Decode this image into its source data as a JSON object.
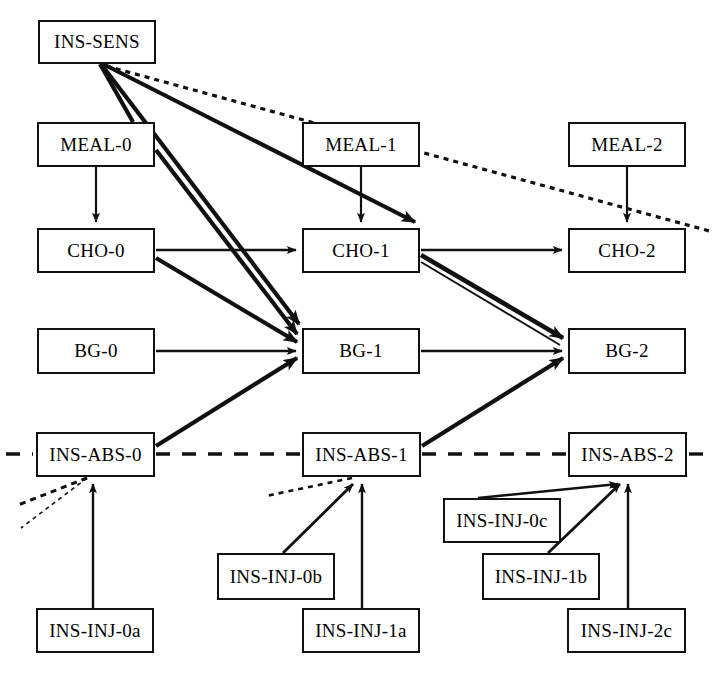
{
  "diagram": {
    "type": "directed-graph",
    "stroke_color": "#111111",
    "background_color": "#ffffff",
    "nodes": [
      {
        "id": "INS-SENS",
        "label": "INS-SENS",
        "x": 38,
        "y": 20,
        "w": 118,
        "h": 44
      },
      {
        "id": "MEAL-0",
        "label": "MEAL-0",
        "x": 37,
        "y": 122,
        "w": 118,
        "h": 45
      },
      {
        "id": "MEAL-1",
        "label": "MEAL-1",
        "x": 302,
        "y": 122,
        "w": 118,
        "h": 45
      },
      {
        "id": "MEAL-2",
        "label": "MEAL-2",
        "x": 568,
        "y": 122,
        "w": 118,
        "h": 45
      },
      {
        "id": "CHO-0",
        "label": "CHO-0",
        "x": 37,
        "y": 228,
        "w": 118,
        "h": 45
      },
      {
        "id": "CHO-1",
        "label": "CHO-1",
        "x": 302,
        "y": 228,
        "w": 118,
        "h": 45
      },
      {
        "id": "CHO-2",
        "label": "CHO-2",
        "x": 568,
        "y": 228,
        "w": 118,
        "h": 45
      },
      {
        "id": "BG-0",
        "label": "BG-0",
        "x": 37,
        "y": 328,
        "w": 118,
        "h": 46
      },
      {
        "id": "BG-1",
        "label": "BG-1",
        "x": 302,
        "y": 328,
        "w": 118,
        "h": 46
      },
      {
        "id": "BG-2",
        "label": "BG-2",
        "x": 568,
        "y": 328,
        "w": 118,
        "h": 46
      },
      {
        "id": "INS-ABS-0",
        "label": "INS-ABS-0",
        "x": 36,
        "y": 432,
        "w": 119,
        "h": 45
      },
      {
        "id": "INS-ABS-1",
        "label": "INS-ABS-1",
        "x": 302,
        "y": 432,
        "w": 119,
        "h": 45
      },
      {
        "id": "INS-ABS-2",
        "label": "INS-ABS-2",
        "x": 568,
        "y": 432,
        "w": 119,
        "h": 45
      },
      {
        "id": "INS-INJ-0c",
        "label": "INS-INJ-0c",
        "x": 443,
        "y": 498,
        "w": 118,
        "h": 45
      },
      {
        "id": "INS-INJ-0b",
        "label": "INS-INJ-0b",
        "x": 217,
        "y": 553,
        "w": 118,
        "h": 47
      },
      {
        "id": "INS-INJ-1b",
        "label": "INS-INJ-1b",
        "x": 482,
        "y": 553,
        "w": 118,
        "h": 47
      },
      {
        "id": "INS-INJ-0a",
        "label": "INS-INJ-0a",
        "x": 36,
        "y": 608,
        "w": 118,
        "h": 45
      },
      {
        "id": "INS-INJ-1a",
        "label": "INS-INJ-1a",
        "x": 302,
        "y": 608,
        "w": 118,
        "h": 45
      },
      {
        "id": "INS-INJ-2c",
        "label": "INS-INJ-2c",
        "x": 567,
        "y": 608,
        "w": 119,
        "h": 45
      }
    ],
    "edges": [
      {
        "from": "INS-SENS",
        "to": "MEAL-0",
        "style": "thick-plain"
      },
      {
        "from": "INS-SENS",
        "to": "CHO-1",
        "style": "thick-arrow"
      },
      {
        "from": "INS-SENS",
        "to": "BG-1",
        "style": "thick-arrow"
      },
      {
        "from": "INS-SENS",
        "to": "CHO-2",
        "style": "dotted"
      },
      {
        "from": "MEAL-0",
        "to": "CHO-0",
        "style": "thin-arrow"
      },
      {
        "from": "MEAL-1",
        "to": "CHO-1",
        "style": "thin-arrow"
      },
      {
        "from": "MEAL-2",
        "to": "CHO-2",
        "style": "thin-arrow"
      },
      {
        "from": "MEAL-0",
        "to": "BG-1",
        "style": "thick-arrow"
      },
      {
        "from": "CHO-0",
        "to": "CHO-1",
        "style": "thin-arrow"
      },
      {
        "from": "CHO-1",
        "to": "CHO-2",
        "style": "thin-arrow"
      },
      {
        "from": "CHO-0",
        "to": "BG-1",
        "style": "thick-arrow"
      },
      {
        "from": "CHO-1",
        "to": "BG-2",
        "style": "thick-arrow-double"
      },
      {
        "from": "BG-0",
        "to": "BG-1",
        "style": "thin-arrow"
      },
      {
        "from": "BG-1",
        "to": "BG-2",
        "style": "thin-arrow"
      },
      {
        "from": "INS-ABS-0",
        "to": "BG-1",
        "style": "thick-arrow"
      },
      {
        "from": "INS-ABS-1",
        "to": "BG-2",
        "style": "thick-arrow"
      },
      {
        "from": "INS-ABS-0",
        "to": "INS-ABS-1",
        "style": "dashed-plain"
      },
      {
        "from": "INS-ABS-1",
        "to": "INS-ABS-2",
        "style": "dashed-plain"
      },
      {
        "from": "INS-INJ-0a",
        "to": "INS-ABS-0",
        "style": "thin-arrow"
      },
      {
        "from": "INS-INJ-0b",
        "to": "INS-ABS-1",
        "style": "thin-arrow"
      },
      {
        "from": "INS-INJ-1a",
        "to": "INS-ABS-1",
        "style": "thin-arrow"
      },
      {
        "from": "INS-INJ-0c",
        "to": "INS-ABS-2",
        "style": "thin-arrow"
      },
      {
        "from": "INS-INJ-1b",
        "to": "INS-ABS-2",
        "style": "thin-arrow"
      },
      {
        "from": "INS-INJ-2c",
        "to": "INS-ABS-2",
        "style": "thin-arrow"
      }
    ],
    "edge_stubs": [
      {
        "name": "left-dash-stub",
        "note": "short dash at left margin entering INS-ABS-0"
      },
      {
        "name": "right-dash-stub",
        "note": "short dash at right margin leaving INS-ABS-2"
      },
      {
        "name": "dotted-stub-ins-abs-0a",
        "note": "dotted line from lower-left margin into INS-ABS-0"
      },
      {
        "name": "dotted-stub-ins-abs-0b",
        "note": "second dotted line from lower-left margin into INS-ABS-0"
      },
      {
        "name": "dotted-stub-ins-abs-1",
        "note": "dotted line from left into INS-ABS-1"
      }
    ]
  }
}
